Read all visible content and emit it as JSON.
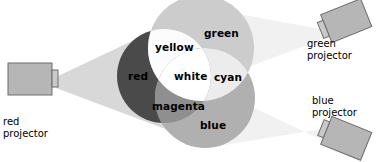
{
  "diagram": {
    "canvas": {
      "width": 379,
      "height": 162,
      "background": "#ffffff"
    },
    "swatch_labels": [
      {
        "key": "green",
        "text": "green",
        "x": 204,
        "y": 27,
        "color": "#000000"
      },
      {
        "key": "yellow",
        "text": "yellow",
        "x": 155,
        "y": 41,
        "color": "#000000"
      },
      {
        "key": "red",
        "text": "red",
        "x": 128,
        "y": 70,
        "color": "#000000"
      },
      {
        "key": "white",
        "text": "white",
        "x": 174,
        "y": 70,
        "color": "#000000"
      },
      {
        "key": "cyan",
        "text": "cyan",
        "x": 214,
        "y": 71,
        "color": "#000000"
      },
      {
        "key": "magenta",
        "text": "magenta",
        "x": 152,
        "y": 100,
        "color": "#000000"
      },
      {
        "key": "blue",
        "text": "blue",
        "x": 200,
        "y": 119,
        "color": "#000000"
      }
    ],
    "projectors": [
      {
        "key": "red",
        "label_line1": "red",
        "label_line2": "projector",
        "label_x": 3,
        "label_y": 118,
        "body_color": "#b5b5b5",
        "outline_color": "#6e6e6e",
        "beam_color": "#d8d8d8"
      },
      {
        "key": "green",
        "label_line1": "green",
        "label_line2": "projector",
        "label_x": 307,
        "label_y": 40,
        "body_color": "#b5b5b5",
        "outline_color": "#6e6e6e",
        "beam_color": "#f1f1f1"
      },
      {
        "key": "blue",
        "label_line1": "blue",
        "label_line2": "projector",
        "label_x": 312,
        "label_y": 97,
        "body_color": "#b5b5b5",
        "outline_color": "#6e6e6e",
        "beam_color": "#f1f1f1"
      }
    ],
    "circles": [
      {
        "key": "red",
        "cx": 164,
        "cy": 76,
        "r": 47,
        "fill": "#4a4a4a"
      },
      {
        "key": "green",
        "cx": 201,
        "cy": 48,
        "r": 53,
        "fill": "#cccccc"
      },
      {
        "key": "blue",
        "cx": 205,
        "cy": 98,
        "r": 50,
        "fill": "#b0b0b0"
      }
    ],
    "overlaps": [
      {
        "key": "yellow",
        "fill": "#fcfcfc"
      },
      {
        "key": "cyan",
        "fill": "#ececec"
      },
      {
        "key": "magenta",
        "fill": "#8f8f8f"
      },
      {
        "key": "white",
        "fill": "#ffffff"
      }
    ]
  }
}
